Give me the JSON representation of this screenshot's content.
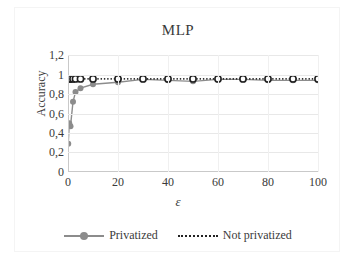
{
  "chart_data": {
    "type": "line",
    "title": "MLP",
    "xlabel": "ε",
    "ylabel": "Accuracy",
    "xlim": [
      0,
      100
    ],
    "ylim": [
      0,
      1.2
    ],
    "xticks": [
      "0",
      "20",
      "40",
      "60",
      "80",
      "100"
    ],
    "xtick_values": [
      0,
      20,
      40,
      60,
      80,
      100
    ],
    "yticks": [
      "0",
      "0,2",
      "0,4",
      "0,6",
      "0,8",
      "1",
      "1,2"
    ],
    "ytick_values": [
      0,
      0.2,
      0.4,
      0.6,
      0.8,
      1.0,
      1.2
    ],
    "grid": true,
    "legend_position": "bottom",
    "series": [
      {
        "name": "Privatized",
        "color": "#8c8c8c",
        "style": "solid",
        "marker": "circle",
        "x": [
          0.1,
          0.5,
          1,
          2,
          3,
          5,
          10,
          20,
          30,
          40,
          50,
          60,
          70,
          80,
          90,
          100
        ],
        "y": [
          0.29,
          0.5,
          0.47,
          0.72,
          0.82,
          0.86,
          0.9,
          0.92,
          0.95,
          0.94,
          0.93,
          0.95,
          0.95,
          0.94,
          0.94,
          0.94
        ]
      },
      {
        "name": "Not privatized",
        "color": "#222222",
        "style": "dotted",
        "marker": "circle-open",
        "x": [
          0.1,
          0.5,
          1,
          2,
          3,
          5,
          10,
          20,
          30,
          40,
          50,
          60,
          70,
          80,
          90,
          100
        ],
        "y": [
          0.955,
          0.955,
          0.955,
          0.955,
          0.955,
          0.955,
          0.955,
          0.955,
          0.955,
          0.955,
          0.955,
          0.955,
          0.955,
          0.955,
          0.955,
          0.955
        ]
      }
    ]
  },
  "legend": {
    "entries": [
      {
        "label": "Privatized"
      },
      {
        "label": "Not privatized"
      }
    ]
  }
}
